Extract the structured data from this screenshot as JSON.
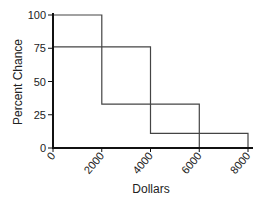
{
  "chart_data": {
    "type": "line",
    "subtype": "step",
    "title": "",
    "xlabel": "Dollars",
    "ylabel": "Percent Chance",
    "xlim": [
      0,
      8000
    ],
    "ylim": [
      0,
      100
    ],
    "x_ticks": [
      0,
      2000,
      4000,
      6000,
      8000
    ],
    "x_tick_labels": [
      "0",
      "2000",
      "4000",
      "6000",
      "8000"
    ],
    "y_ticks": [
      0,
      25,
      50,
      75,
      100
    ],
    "y_tick_labels": [
      "0",
      "25",
      "50",
      "75",
      "100"
    ],
    "grid": false,
    "legend": null,
    "series": [
      {
        "name": "Option A",
        "color": "#444444",
        "points": [
          [
            0,
            100
          ],
          [
            2000,
            100
          ],
          [
            2000,
            33
          ],
          [
            6000,
            33
          ],
          [
            6000,
            0
          ]
        ]
      },
      {
        "name": "Option B",
        "color": "#444444",
        "points": [
          [
            0,
            76
          ],
          [
            4000,
            76
          ],
          [
            4000,
            11
          ],
          [
            8000,
            11
          ],
          [
            8000,
            0
          ]
        ]
      }
    ]
  }
}
